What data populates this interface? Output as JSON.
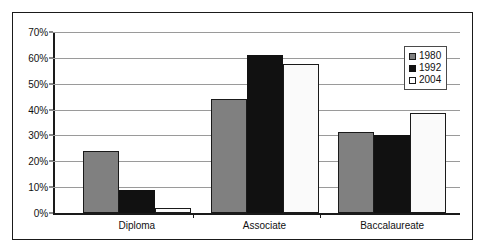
{
  "chart_data": {
    "type": "bar",
    "title": "",
    "xlabel": "",
    "ylabel": "",
    "categories": [
      "Diploma",
      "Associate",
      "Baccalaureate"
    ],
    "series": [
      {
        "name": "1980",
        "color": "#808080",
        "values": [
          24,
          44,
          31.5
        ]
      },
      {
        "name": "1992",
        "color": "#111111",
        "values": [
          9,
          61,
          30
        ]
      },
      {
        "name": "2004",
        "color": "#fafafa",
        "values": [
          2,
          57.5,
          38.5
        ]
      }
    ],
    "ylim": [
      0,
      70
    ],
    "y_ticks": [
      0,
      10,
      20,
      30,
      40,
      50,
      60,
      70
    ],
    "y_tick_labels": [
      "0%",
      "10%",
      "20%",
      "30%",
      "40%",
      "50%",
      "60%",
      "70%"
    ],
    "grid": true,
    "legend_position": "top-right",
    "value_suffix": "%"
  },
  "legend": {
    "items": [
      {
        "label": "1980",
        "swatch": "gray-square-swatch"
      },
      {
        "label": "1992",
        "swatch": "black-square-swatch"
      },
      {
        "label": "2004",
        "swatch": "white-square-swatch"
      }
    ]
  },
  "colors": {
    "series_1980": "#808080",
    "series_1992": "#111111",
    "series_2004": "#fafafa",
    "gridline": "#9a9a9a",
    "axis": "#1a1a1a",
    "frame": "#1a1a1a",
    "background": "#ffffff"
  }
}
